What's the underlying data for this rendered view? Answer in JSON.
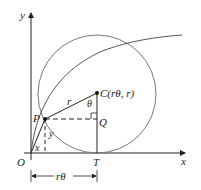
{
  "diagram": {
    "colors": {
      "axis": "#222222",
      "circle": "#777777",
      "curve": "#555555",
      "line": "#222222"
    },
    "labels": {
      "y_axis": "y",
      "x_axis": "x",
      "origin": "O",
      "point_p": "P",
      "point_c": "C(rθ, r)",
      "point_q": "Q",
      "point_t": "T",
      "radius": "r",
      "angle": "θ",
      "seg_x": "x",
      "seg_y": "y",
      "arc_length": "rθ"
    }
  }
}
